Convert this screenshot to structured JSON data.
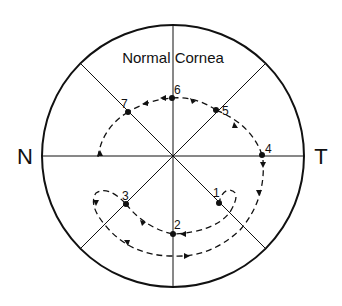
{
  "title": "Normal Cornea",
  "axis_labels": {
    "left": "N",
    "right": "T"
  },
  "points": [
    {
      "label": "1",
      "x": 219,
      "y": 203
    },
    {
      "label": "2",
      "x": 173,
      "y": 234
    },
    {
      "label": "3",
      "x": 126,
      "y": 204
    },
    {
      "label": "4",
      "x": 262,
      "y": 155
    },
    {
      "label": "5",
      "x": 216,
      "y": 110
    },
    {
      "label": "6",
      "x": 172,
      "y": 98
    },
    {
      "label": "7",
      "x": 128,
      "y": 112
    }
  ],
  "colors": {
    "line": "#111111",
    "background": "#ffffff"
  }
}
